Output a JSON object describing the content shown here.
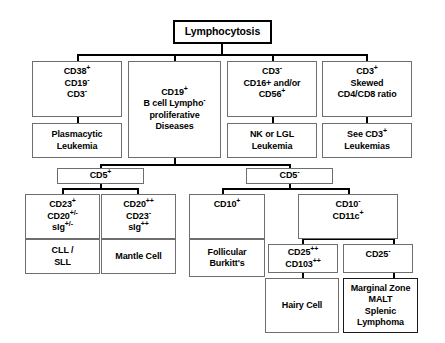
{
  "diagram": {
    "title": "Lymphocytosis",
    "type": "clinical-flowchart",
    "root": {
      "label": "Lymphocytosis"
    },
    "level1": [
      {
        "id": "cd38",
        "line1": "CD38+",
        "line2": "CD19-",
        "line3": "CD3-"
      },
      {
        "id": "cd19",
        "line1": "CD19+",
        "line2": "B cell Lympho-",
        "line3": "proliferative",
        "line4": "Diseases"
      },
      {
        "id": "cd3neg",
        "line1": "CD3-",
        "line2": "CD16+ and/or",
        "line3": "CD56+"
      },
      {
        "id": "cd3pos",
        "line1": "CD3+",
        "line2": "Skewed",
        "line3": "CD4/CD8 ratio"
      }
    ],
    "level1_outcomes": [
      {
        "id": "plasmacytic",
        "line1": "Plasmacytic",
        "line2": "Leukemia"
      },
      {
        "id": "nklgl",
        "line1": "NK or LGL",
        "line2": "Leukemia"
      },
      {
        "id": "seecd3",
        "line1": "See CD3+",
        "line2": "Leukemias"
      }
    ],
    "level2": [
      {
        "id": "cd5pos",
        "label": "CD5+"
      },
      {
        "id": "cd5neg",
        "label": "CD5-"
      }
    ],
    "level3": [
      {
        "id": "cd23pos",
        "line1": "CD23+",
        "line2": "CD20+/-",
        "line3": "sIg+/-"
      },
      {
        "id": "cd20pp",
        "line1": "CD20++",
        "line2": "CD23-",
        "line3": "sIg++"
      },
      {
        "id": "cd10pos",
        "line1": "CD10+"
      },
      {
        "id": "cd10neg",
        "line1": "CD10-",
        "line2": "CD11c+"
      }
    ],
    "level3_outcomes": [
      {
        "id": "cllsll",
        "line1": "CLL /",
        "line2": "SLL"
      },
      {
        "id": "mantle",
        "line1": "Mantle Cell"
      },
      {
        "id": "follicular",
        "line1": "Follicular",
        "line2": "Burkitt's"
      }
    ],
    "level4": [
      {
        "id": "cd25pp",
        "line1": "CD25++",
        "line2": "CD103++"
      },
      {
        "id": "cd25neg",
        "line1": "CD25-"
      }
    ],
    "level4_outcomes": [
      {
        "id": "hairycell",
        "line1": "Hairy Cell"
      },
      {
        "id": "marginalzone",
        "line1": "Marginal Zone",
        "line2": "MALT",
        "line3": "Splenic",
        "line4": "Lymphoma"
      }
    ],
    "colors": {
      "background": "#ffffff",
      "box_border": "#6e6e6e",
      "root_border": "#000000",
      "connector": "#000000",
      "text": "#000000"
    }
  }
}
